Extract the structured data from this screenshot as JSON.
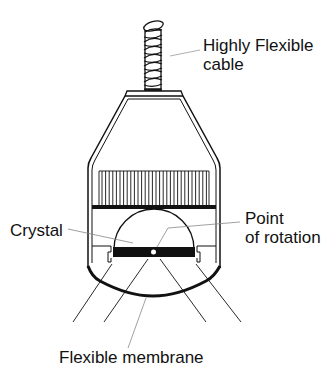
{
  "diagram": {
    "colors": {
      "line": "#111111",
      "leader": "#888888",
      "background": "#ffffff"
    },
    "labels": {
      "cable": [
        "Highly Flexible",
        "cable"
      ],
      "crystal": "Crystal",
      "point_of_rotation": [
        "Point",
        "of rotation"
      ],
      "membrane": "Flexible membrane"
    },
    "components": [
      "highly-flexible-cable",
      "housing",
      "backing-fins",
      "crystal",
      "point-of-rotation",
      "flexible-membrane",
      "ultrasound-beam-lines"
    ]
  }
}
